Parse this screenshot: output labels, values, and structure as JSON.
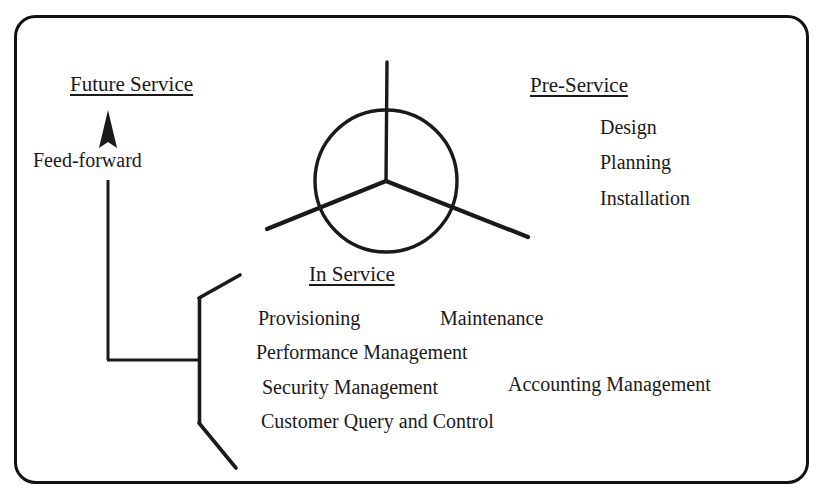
{
  "diagram": {
    "border": {
      "style": "rounded-rectangle",
      "color": "#111111"
    },
    "hub": {
      "name": "three-segment-circle",
      "description": "Circle divided into three equal sectors by spokes that extend outward toward each labelled service phase",
      "spokes": [
        "up-to-future-service",
        "down-right-to-pre-service",
        "down-left-to-in-service"
      ],
      "color": "#1a1a1a"
    },
    "future_service": {
      "heading": "Future Service",
      "arrow_label": "Feed-forward",
      "arrow_direction": "up"
    },
    "pre_service": {
      "heading": "Pre-Service",
      "items": [
        "Design",
        "Planning",
        "Installation"
      ]
    },
    "in_service": {
      "heading": "In Service",
      "items": [
        "Provisioning",
        "Maintenance",
        "Performance Management",
        "Security Management",
        "Accounting Management",
        "Customer Query and Control"
      ]
    }
  }
}
